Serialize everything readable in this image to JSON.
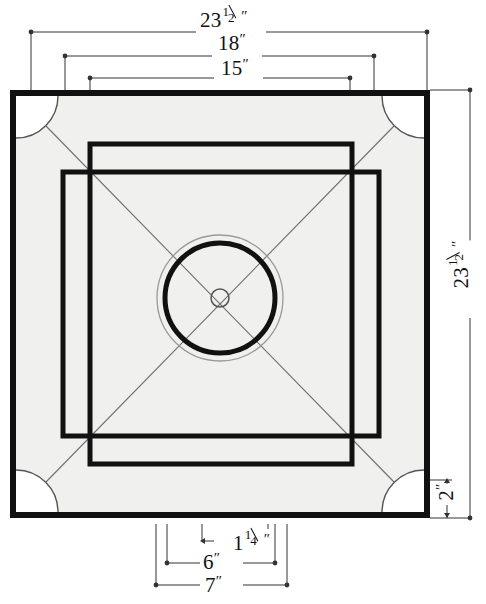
{
  "figure": {
    "units": "inches",
    "colors": {
      "ink": "#111111",
      "board_surface": "#f0f0ee",
      "pocket_fill": "#ffffff",
      "thin_line": "#8c8c8c",
      "page_background": "#ffffff"
    }
  },
  "dimensions": {
    "top": [
      {
        "id": "overall-width",
        "whole": "23",
        "numerator": "1",
        "denominator": "2",
        "inch_mark": "″",
        "value_in": 23.5,
        "has_fraction": true
      },
      {
        "id": "playfield-width",
        "whole": "18",
        "inch_mark": "″",
        "value_in": 18,
        "has_fraction": false
      },
      {
        "id": "inner-square-width",
        "whole": "15",
        "inch_mark": "″",
        "value_in": 15,
        "has_fraction": false
      }
    ],
    "right": [
      {
        "id": "overall-height",
        "whole": "23",
        "numerator": "1",
        "denominator": "2",
        "inch_mark": "″",
        "value_in": 23.5,
        "has_fraction": true
      },
      {
        "id": "frame-border-width",
        "whole": "2",
        "inch_mark": "″",
        "value_in": 2,
        "has_fraction": false
      }
    ],
    "bottom": [
      {
        "id": "base-line-thickness",
        "whole": "1",
        "numerator": "1",
        "denominator": "4",
        "inch_mark": "″",
        "value_in": 1.25,
        "has_fraction": true
      },
      {
        "id": "base-line-inner",
        "whole": "6",
        "inch_mark": "″",
        "value_in": 6,
        "has_fraction": false
      },
      {
        "id": "base-line-outer",
        "whole": "7",
        "inch_mark": "″",
        "value_in": 7,
        "has_fraction": false
      }
    ]
  },
  "board": {
    "outer_frame": {
      "x": 10,
      "y": 90,
      "width": 420,
      "height": 428,
      "stroke_width": 6
    },
    "surface": {
      "x": 16,
      "y": 96,
      "width": 408,
      "height": 416
    },
    "pockets": [
      {
        "id": "pocket-top-left",
        "cx": 16,
        "cy": 96,
        "r": 42
      },
      {
        "id": "pocket-top-right",
        "cx": 424,
        "cy": 96,
        "r": 42
      },
      {
        "id": "pocket-bottom-left",
        "cx": 16,
        "cy": 512,
        "r": 42
      },
      {
        "id": "pocket-bottom-right",
        "cx": 424,
        "cy": 512,
        "r": 42
      }
    ],
    "base_line_horizontal": {
      "x": 90,
      "y": 144,
      "width": 262,
      "height": 320,
      "stroke_width": 5
    },
    "base_line_vertical": {
      "x": 63,
      "y": 172,
      "width": 316,
      "height": 264,
      "stroke_width": 5
    },
    "guide_square": {
      "x": 90,
      "y": 172,
      "width": 262,
      "height": 264
    },
    "diagonals": [
      {
        "id": "diagonal-tl-br",
        "x1": 46,
        "y1": 126,
        "x2": 394,
        "y2": 482
      },
      {
        "id": "diagonal-tr-bl",
        "x1": 394,
        "y1": 126,
        "x2": 46,
        "y2": 482
      }
    ],
    "center_circles": [
      {
        "id": "center-outer-ring",
        "cx": 220,
        "cy": 298,
        "r": 63,
        "stroke_width": 1.2
      },
      {
        "id": "center-main-ring",
        "cx": 220,
        "cy": 298,
        "r": 55,
        "stroke_width": 5
      },
      {
        "id": "center-spot",
        "cx": 220,
        "cy": 298,
        "r": 9,
        "stroke_width": 1.4
      }
    ]
  }
}
